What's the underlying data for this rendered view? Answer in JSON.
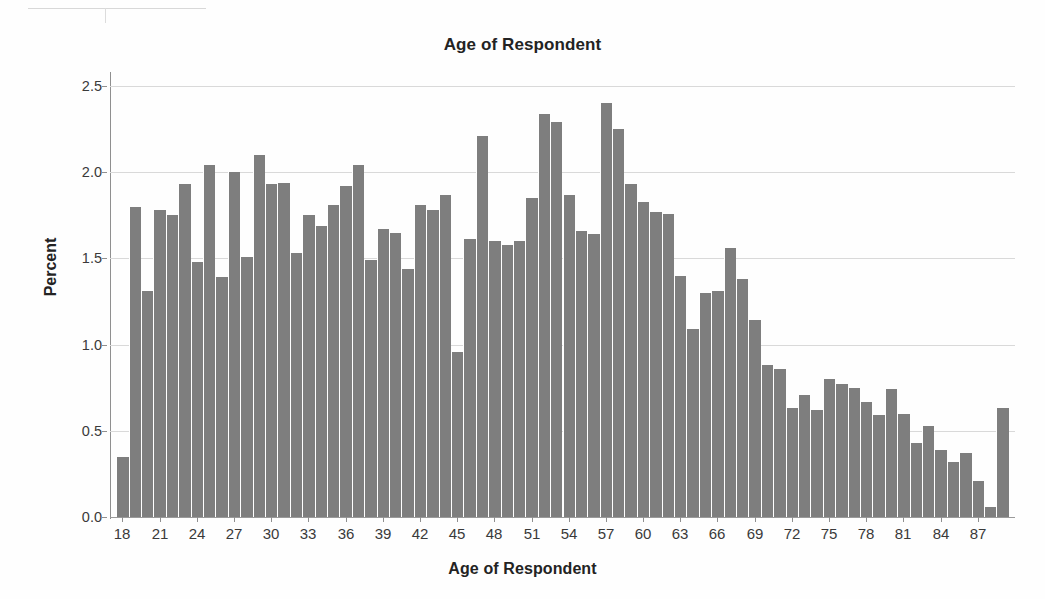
{
  "chart_data": {
    "type": "bar",
    "title": "Age of Respondent",
    "xlabel": "Age of Respondent",
    "ylabel": "Percent",
    "grid": true,
    "legend": false,
    "xlim": [
      17,
      90
    ],
    "ylim": [
      0.0,
      2.5
    ],
    "ytick_labels": [
      "0.0",
      "0.5",
      "1.0",
      "1.5",
      "2.0",
      "2.5"
    ],
    "ytick_values": [
      0.0,
      0.5,
      1.0,
      1.5,
      2.0,
      2.5
    ],
    "xtick_labels": [
      "18",
      "21",
      "24",
      "27",
      "30",
      "33",
      "36",
      "39",
      "42",
      "45",
      "48",
      "51",
      "54",
      "57",
      "60",
      "63",
      "66",
      "69",
      "72",
      "75",
      "78",
      "81",
      "84",
      "87"
    ],
    "xtick_values": [
      18,
      21,
      24,
      27,
      30,
      33,
      36,
      39,
      42,
      45,
      48,
      51,
      54,
      57,
      60,
      63,
      66,
      69,
      72,
      75,
      78,
      81,
      84,
      87
    ],
    "categories": [
      18,
      19,
      20,
      21,
      22,
      23,
      24,
      25,
      26,
      27,
      28,
      29,
      30,
      31,
      32,
      33,
      34,
      35,
      36,
      37,
      38,
      39,
      40,
      41,
      42,
      43,
      44,
      45,
      46,
      47,
      48,
      49,
      50,
      51,
      52,
      53,
      54,
      55,
      56,
      57,
      58,
      59,
      60,
      61,
      62,
      63,
      64,
      65,
      66,
      67,
      68,
      69,
      70,
      71,
      72,
      73,
      74,
      75,
      76,
      77,
      78,
      79,
      80,
      81,
      82,
      83,
      84,
      85,
      86,
      87,
      88,
      89
    ],
    "values": [
      0.35,
      1.8,
      1.31,
      1.78,
      1.75,
      1.93,
      1.48,
      2.04,
      1.39,
      2.0,
      1.51,
      2.1,
      1.93,
      1.94,
      1.53,
      1.75,
      1.69,
      1.81,
      1.92,
      2.04,
      1.49,
      1.67,
      1.65,
      1.44,
      1.81,
      1.78,
      1.87,
      0.96,
      1.61,
      2.21,
      1.6,
      1.58,
      1.6,
      1.85,
      2.34,
      2.29,
      1.87,
      1.66,
      1.64,
      2.4,
      2.25,
      1.93,
      1.83,
      1.77,
      1.76,
      1.4,
      1.09,
      1.3,
      1.31,
      1.56,
      1.38,
      1.14,
      0.88,
      0.86,
      0.63,
      0.71,
      0.62,
      0.8,
      0.77,
      0.75,
      0.67,
      0.59,
      0.74,
      0.6,
      0.43,
      0.53,
      0.39,
      0.32,
      0.37,
      0.21,
      0.06,
      0.63
    ],
    "bar_color": "#7e7e7e",
    "grid_color": "#d9d9d9",
    "axis_color": "#8f8f8f",
    "background_color": "#ffffff"
  }
}
